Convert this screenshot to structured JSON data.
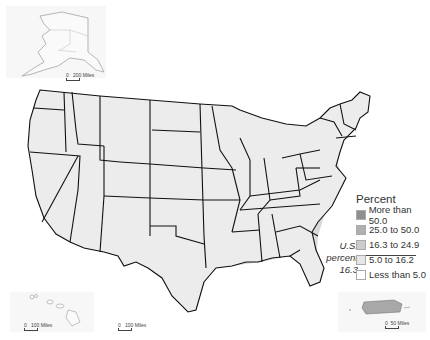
{
  "legend": {
    "title": "Percent",
    "items": [
      {
        "label": "More than 50.0",
        "color": "#8f8f8f"
      },
      {
        "label": "25.0 to 50.0",
        "color": "#b0b0b0"
      },
      {
        "label": "16.3 to 24.9",
        "color": "#cccccc"
      },
      {
        "label": "5.0 to 16.2",
        "color": "#e6e6e6"
      },
      {
        "label": "Less than 5.0",
        "color": "#ffffff"
      }
    ]
  },
  "us_note": {
    "line1": "U.S.",
    "line2": "percent",
    "line3": "16.3"
  },
  "scales": {
    "alaska": "200 Miles",
    "hawaii": "100 Miles",
    "conus": "100 Miles",
    "puerto_rico": "50 Miles",
    "zero": "0"
  },
  "insets": [
    "Alaska",
    "Hawaii",
    "Puerto Rico"
  ]
}
